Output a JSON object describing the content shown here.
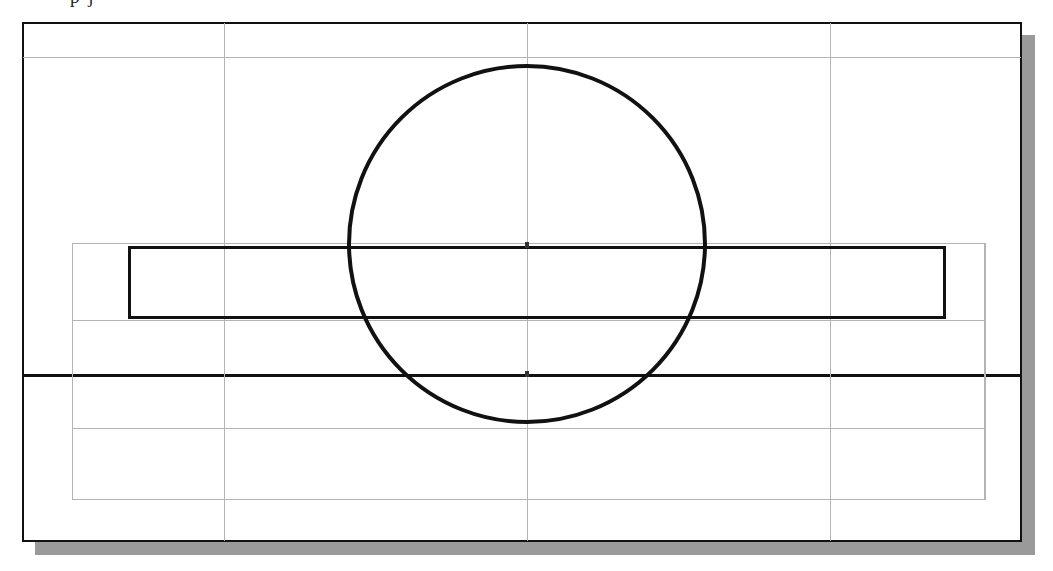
{
  "document": {
    "type": "engineering-drawing-scan",
    "background_color": "#ffffff",
    "clipped_header_text": "p     j"
  },
  "frame": {
    "x": 22,
    "y": 22,
    "width": 1000,
    "height": 520,
    "border_color": "#111111",
    "border_width": 2,
    "shadow_color": "#9a9a9a",
    "shadow_offset_x": 13,
    "shadow_offset_y": 13
  },
  "colors": {
    "ink": "#111111",
    "grid": "#b4b4b4",
    "shadow": "#9a9a9a",
    "sheet": "#ffffff"
  },
  "grid": {
    "horizontal_lines": [
      {
        "name": "grid-h-top",
        "y": 57,
        "x": 23,
        "width": 998,
        "weight": "light"
      },
      {
        "name": "grid-h-rect-top",
        "y": 243,
        "x": 72,
        "width": 913,
        "weight": "light"
      },
      {
        "name": "grid-h-rect-bottom",
        "y": 320,
        "x": 72,
        "width": 913,
        "weight": "light"
      },
      {
        "name": "grid-h-center",
        "y": 374,
        "x": 23,
        "width": 998,
        "weight": "heavy"
      },
      {
        "name": "grid-h-lower",
        "y": 428,
        "x": 72,
        "width": 913,
        "weight": "light"
      },
      {
        "name": "grid-h-bottom",
        "y": 499,
        "x": 72,
        "width": 913,
        "weight": "light"
      }
    ],
    "vertical_lines": [
      {
        "name": "grid-v-left",
        "x": 224,
        "y": 23,
        "height": 518,
        "weight": "light"
      },
      {
        "name": "grid-v-center",
        "x": 527,
        "y": 23,
        "height": 518,
        "weight": "light"
      },
      {
        "name": "grid-v-right",
        "x": 830,
        "y": 23,
        "height": 518,
        "weight": "light"
      },
      {
        "name": "grid-v-rect-left",
        "x": 72,
        "y": 243,
        "height": 257,
        "weight": "light"
      },
      {
        "name": "grid-v-rect-right",
        "x": 985,
        "y": 243,
        "height": 257,
        "weight": "light"
      }
    ]
  },
  "shapes": {
    "circle": {
      "name": "profile-circle",
      "center_x": 527,
      "center_y": 244,
      "radius": 180,
      "stroke_color": "#111111",
      "stroke_width": 4,
      "fill": "none"
    },
    "black_rectangle": {
      "name": "plate-profile-rectangle",
      "x": 128,
      "y": 246,
      "width": 818,
      "height": 73,
      "stroke_color": "#111111",
      "stroke_width": 3,
      "fill": "none"
    },
    "gray_rectangle": {
      "name": "construction-rectangle",
      "x": 72,
      "y": 243,
      "width": 913,
      "height": 257,
      "stroke_color": "#b4b4b4",
      "stroke_width": 1,
      "fill": "none"
    },
    "center_marks": [
      {
        "name": "center-mark-primary",
        "x": 525,
        "y": 371,
        "style": "dark"
      },
      {
        "name": "center-mark-secondary",
        "x": 525,
        "y": 242,
        "style": "dark"
      }
    ]
  }
}
